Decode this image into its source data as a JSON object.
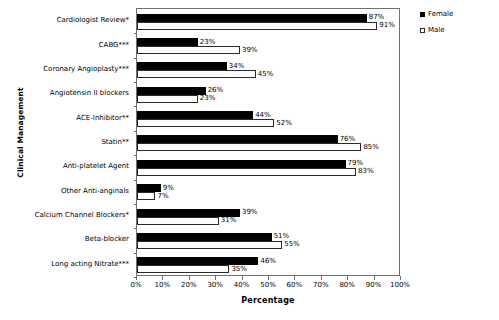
{
  "chart_data": {
    "type": "bar",
    "orientation": "horizontal",
    "title": "",
    "xlabel": "Percentage",
    "ylabel": "Clinical Management",
    "xlim": [
      0,
      100
    ],
    "xticks": [
      "0%",
      "10%",
      "20%",
      "30%",
      "40%",
      "50%",
      "60%",
      "70%",
      "80%",
      "90%",
      "100%"
    ],
    "xtick_values": [
      0,
      10,
      20,
      30,
      40,
      50,
      60,
      70,
      80,
      90,
      100
    ],
    "grid": false,
    "legend_position": "top-right",
    "categories": [
      "Cardiologist Review*",
      "CABG***",
      "Coronary Angioplasty***",
      "Angiotensin II blockers",
      "ACE-Inhibitor**",
      "Statin**",
      "Anti-platelet Agent",
      "Other Anti-anginals",
      "Calcium Channel Blockers*",
      "Beta-blocker",
      "Long acting Nitrate***"
    ],
    "series": [
      {
        "name": "Female",
        "color": "#000000",
        "values": [
          87,
          23,
          34,
          26,
          44,
          76,
          79,
          9,
          39,
          51,
          46
        ],
        "labels": [
          "87%",
          "23%",
          "34%",
          "26%",
          "44%",
          "76%",
          "79%",
          "9%",
          "39%",
          "51%",
          "46%"
        ]
      },
      {
        "name": "Male",
        "color": "#ffffff",
        "values": [
          91,
          39,
          45,
          23,
          52,
          85,
          83,
          7,
          31,
          55,
          35
        ],
        "labels": [
          "91%",
          "39%",
          "45%",
          "23%",
          "52%",
          "85%",
          "83%",
          "7%",
          "31%",
          "55%",
          "35%"
        ]
      }
    ]
  },
  "legend": {
    "entries": [
      {
        "label": "Female",
        "swatch": "filled-square-icon"
      },
      {
        "label": "Male",
        "swatch": "open-square-icon"
      }
    ]
  }
}
